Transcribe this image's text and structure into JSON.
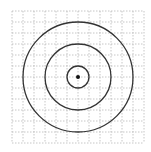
{
  "diagram": {
    "grid": {
      "x0": 12,
      "y0": 11,
      "cell": 11,
      "cols": 12,
      "rows": 12,
      "color": "#b8b8b8"
    },
    "center": {
      "x": 78,
      "y": 77
    },
    "circles": [
      {
        "r": 11,
        "color": "#333333"
      },
      {
        "r": 33,
        "color": "#333333"
      },
      {
        "r": 55,
        "color": "#333333"
      }
    ],
    "center_dot": {
      "r": 2,
      "color": "#111111"
    }
  }
}
